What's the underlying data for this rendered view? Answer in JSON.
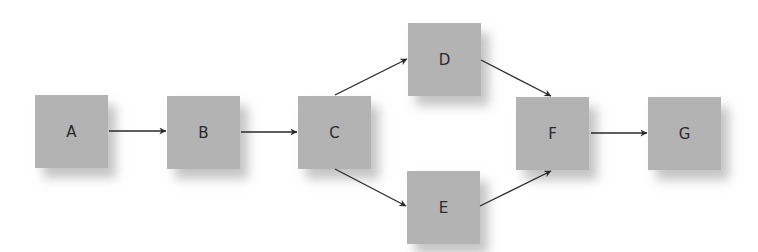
{
  "diagram": {
    "type": "flow",
    "nodes": [
      {
        "id": "A",
        "label": "A",
        "x": 35,
        "y": 95
      },
      {
        "id": "B",
        "label": "B",
        "x": 167,
        "y": 96
      },
      {
        "id": "C",
        "label": "C",
        "x": 298,
        "y": 96
      },
      {
        "id": "D",
        "label": "D",
        "x": 408,
        "y": 23
      },
      {
        "id": "E",
        "label": "E",
        "x": 407,
        "y": 171
      },
      {
        "id": "F",
        "label": "F",
        "x": 516,
        "y": 97
      },
      {
        "id": "G",
        "label": "G",
        "x": 648,
        "y": 97
      }
    ],
    "edges": [
      {
        "from": "A",
        "to": "B"
      },
      {
        "from": "B",
        "to": "C"
      },
      {
        "from": "C",
        "to": "D"
      },
      {
        "from": "C",
        "to": "E"
      },
      {
        "from": "D",
        "to": "F"
      },
      {
        "from": "E",
        "to": "F"
      },
      {
        "from": "F",
        "to": "G"
      }
    ],
    "colors": {
      "node_fill": "#b3b3b3",
      "edge": "#2a2a2a",
      "background": "#ffffff"
    }
  }
}
